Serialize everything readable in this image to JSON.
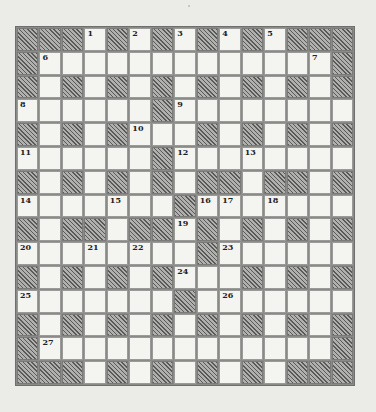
{
  "puzzle": {
    "type": "crossword",
    "rows": 15,
    "cols": 15,
    "layout": [
      "###.#.#.#.#.###",
      "#.............#",
      "#.#.#.#.#.#.#.#",
      "......#........",
      "#.#.#...#.#.#.#",
      "......#........",
      "#.#.#.#.##.##.#",
      ".......#.......",
      "#.##.##.#.#.#.#",
      "........#......",
      "#.#.#.#...#.#.#",
      ".......#.......",
      "#.#.#.#.#.#.#.#",
      "#.............#",
      "###.#.#.#.#.###"
    ],
    "numbers": [
      {
        "row": 0,
        "col": 3,
        "n": "1"
      },
      {
        "row": 0,
        "col": 5,
        "n": "2"
      },
      {
        "row": 0,
        "col": 7,
        "n": "3"
      },
      {
        "row": 0,
        "col": 9,
        "n": "4"
      },
      {
        "row": 0,
        "col": 11,
        "n": "5"
      },
      {
        "row": 1,
        "col": 1,
        "n": "6"
      },
      {
        "row": 1,
        "col": 13,
        "n": "7"
      },
      {
        "row": 3,
        "col": 0,
        "n": "8"
      },
      {
        "row": 3,
        "col": 7,
        "n": "9"
      },
      {
        "row": 4,
        "col": 5,
        "n": "10"
      },
      {
        "row": 5,
        "col": 0,
        "n": "11"
      },
      {
        "row": 5,
        "col": 7,
        "n": "12"
      },
      {
        "row": 5,
        "col": 10,
        "n": "13"
      },
      {
        "row": 7,
        "col": 0,
        "n": "14"
      },
      {
        "row": 7,
        "col": 4,
        "n": "15"
      },
      {
        "row": 7,
        "col": 8,
        "n": "16"
      },
      {
        "row": 7,
        "col": 9,
        "n": "17"
      },
      {
        "row": 7,
        "col": 11,
        "n": "18"
      },
      {
        "row": 8,
        "col": 7,
        "n": "19"
      },
      {
        "row": 9,
        "col": 0,
        "n": "20"
      },
      {
        "row": 9,
        "col": 3,
        "n": "21"
      },
      {
        "row": 9,
        "col": 5,
        "n": "22"
      },
      {
        "row": 9,
        "col": 9,
        "n": "23"
      },
      {
        "row": 10,
        "col": 7,
        "n": "24"
      },
      {
        "row": 11,
        "col": 0,
        "n": "25"
      },
      {
        "row": 11,
        "col": 9,
        "n": "26"
      },
      {
        "row": 13,
        "col": 1,
        "n": "27"
      }
    ],
    "colors": {
      "paper": "#ebebe8",
      "white_cell": "#f4f4f1",
      "hatch_dark": "#5a5a58",
      "hatch_light": "#b0b0ae",
      "grid_line": "#8a8a88"
    }
  }
}
